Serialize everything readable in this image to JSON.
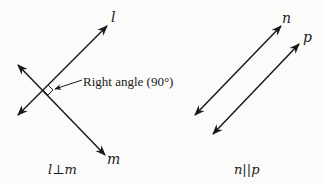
{
  "figure": {
    "left": {
      "line_l_label": "l",
      "line_m_label": "m",
      "annotation": "Right angle (90°)",
      "caption": "l⊥m"
    },
    "right": {
      "line_n_label": "n",
      "line_p_label": "p",
      "caption": "n||p"
    },
    "colors": {
      "line": "#1a1a1a",
      "background": "#fbfbf9"
    }
  }
}
